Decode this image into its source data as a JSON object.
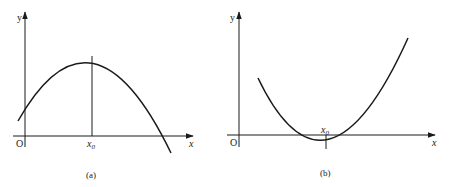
{
  "figure": {
    "panels": [
      {
        "id": "a",
        "caption": "(a)",
        "axis_x_label": "x",
        "axis_y_label": "y",
        "origin_label": "O",
        "marker_label": "x",
        "marker_subscript": "0",
        "curve": "concave-down parabola with maximum at x0",
        "stroke_color": "#1a1a1a"
      },
      {
        "id": "b",
        "caption": "(b)",
        "axis_x_label": "x",
        "axis_y_label": "y",
        "origin_label": "O",
        "marker_label": "x",
        "marker_subscript": "0",
        "curve": "concave-up parabola with minimum at x0 below x-axis",
        "stroke_color": "#1a1a1a"
      }
    ]
  }
}
